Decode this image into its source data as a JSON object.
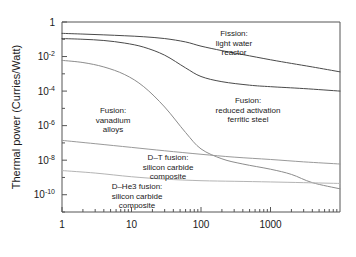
{
  "chart_data": {
    "type": "line",
    "title": "",
    "xlabel": "",
    "ylabel": "Thermal power (Curries/Watt)",
    "xscale": "log",
    "yscale": "log",
    "xlim": [
      1,
      10000
    ],
    "ylim": [
      1e-11,
      1
    ],
    "grid": false,
    "legend_position": "inline-annotations",
    "xticks": [
      "1",
      "10",
      "100",
      "1000"
    ],
    "xtick_values": [
      1,
      10,
      100,
      1000
    ],
    "yticks": [
      "1",
      "10-2",
      "10-4",
      "10-6",
      "10-8",
      "10-10"
    ],
    "ytick_values": [
      1,
      0.01,
      0.0001,
      1e-06,
      1e-08,
      1e-10
    ],
    "ytick_mantissa": [
      "1",
      "10",
      "10",
      "10",
      "10",
      "10"
    ],
    "ytick_exponent": [
      "",
      "-2",
      "-4",
      "-6",
      "-8",
      "-10"
    ],
    "series": [
      {
        "name": "Fission: light water reactor",
        "color": "#4a4a4a",
        "x": [
          1,
          2,
          4,
          8,
          15,
          30,
          60,
          100,
          200,
          400,
          1000,
          2000,
          4000,
          10000
        ],
        "y": [
          0.22,
          0.2,
          0.18,
          0.16,
          0.14,
          0.11,
          0.07,
          0.04,
          0.022,
          0.013,
          0.0065,
          0.004,
          0.0025,
          0.0013
        ]
      },
      {
        "name": "Fusion: reduced activation ferritic steel",
        "color": "#4a4a4a",
        "x": [
          1,
          2,
          4,
          8,
          15,
          30,
          60,
          100,
          200,
          500,
          1000,
          3000,
          10000
        ],
        "y": [
          0.11,
          0.1,
          0.085,
          0.06,
          0.035,
          0.012,
          0.0022,
          0.0007,
          0.00035,
          0.00022,
          0.00018,
          0.00014,
          0.0001
        ]
      },
      {
        "name": "Fusion: vanadium alloys",
        "color": "#8c8c8c",
        "x": [
          1,
          2,
          4,
          8,
          15,
          30,
          60,
          100,
          200,
          400,
          1000,
          2000,
          4000,
          10000
        ],
        "y": [
          0.006,
          0.0045,
          0.0025,
          0.0009,
          0.00018,
          1.2e-05,
          4e-07,
          4.5e-08,
          1.2e-08,
          6e-09,
          3e-09,
          1.5e-09,
          5e-10,
          2.2e-10
        ]
      },
      {
        "name": "D-T fusion: silicon carbide composite",
        "color": "#9a9a9a",
        "x": [
          1,
          3,
          10,
          30,
          100,
          300,
          1000,
          3000,
          10000
        ],
        "y": [
          1.4e-07,
          9e-08,
          5.5e-08,
          3.5e-08,
          2.2e-08,
          1.5e-08,
          1.1e-08,
          8e-09,
          6e-09
        ]
      },
      {
        "name": "D-He3 fusion: silicon carbide composite",
        "color": "#b4b4b4",
        "x": [
          1,
          3,
          10,
          30,
          100,
          300,
          1000,
          3000,
          10000
        ],
        "y": [
          2.5e-09,
          1.8e-09,
          1.1e-09,
          8e-10,
          6.5e-10,
          6e-10,
          5.5e-10,
          5e-10,
          4.5e-10
        ]
      }
    ],
    "annotations": [
      {
        "name": "fission-lwr",
        "lines": [
          "Fission:",
          "light water",
          "reactor"
        ],
        "x": 234,
        "y": 36
      },
      {
        "name": "fusion-ferritic-steel",
        "lines": [
          "Fusion:",
          "reduced activation",
          "ferritic steel"
        ],
        "x": 248,
        "y": 103
      },
      {
        "name": "fusion-vanadium-alloys",
        "lines": [
          "Fusion:",
          "vanadium",
          "alloys"
        ],
        "x": 113,
        "y": 113
      },
      {
        "name": "dt-fusion-sic",
        "lines": [
          "D–T fusion:",
          "silicon carbide",
          "composite"
        ],
        "x": 168,
        "y": 160
      },
      {
        "name": "dhe3-fusion-sic",
        "lines": [
          "D–He3 fusion:",
          "silicon carbide",
          "composite"
        ],
        "x": 137,
        "y": 189
      }
    ]
  }
}
